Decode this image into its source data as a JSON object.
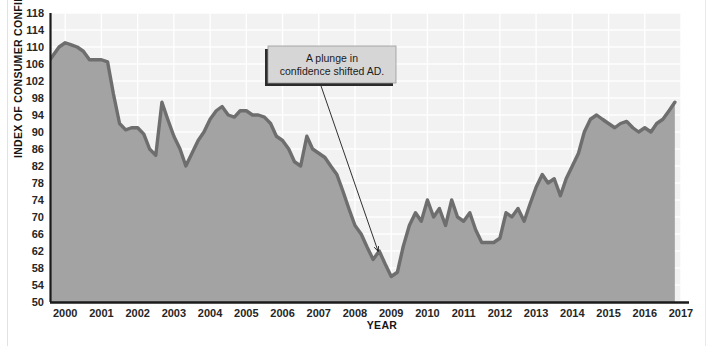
{
  "chart_data": {
    "type": "area",
    "title": "",
    "xlabel": "YEAR",
    "ylabel": "INDEX OF CONSUMER CONFIDENCE",
    "xlim": [
      1999.58,
      2017.0
    ],
    "ylim": [
      50,
      118
    ],
    "ytick_step": 4,
    "grid": true,
    "legend": false,
    "yticks": [
      50,
      54,
      58,
      62,
      66,
      70,
      74,
      78,
      82,
      86,
      90,
      94,
      98,
      102,
      106,
      110,
      114,
      118
    ],
    "xticks": [
      2000,
      2001,
      2002,
      2003,
      2004,
      2005,
      2006,
      2007,
      2008,
      2009,
      2010,
      2011,
      2012,
      2013,
      2014,
      2015,
      2016,
      2017
    ],
    "colors": {
      "line": "#6e6e6e",
      "fill": "#a3a3a3",
      "plot_background": "#f2f2f2",
      "gridline": "#ffffff",
      "axis": "#1a1a1a",
      "text": "#262626",
      "callout_fill": "#d6d6d6",
      "callout_shadow": "#2b2b2b"
    },
    "series": [
      {
        "name": "Index of Consumer Confidence",
        "x": [
          1999.58,
          1999.83,
          2000.0,
          2000.17,
          2000.33,
          2000.5,
          2000.67,
          2000.83,
          2001.0,
          2001.17,
          2001.33,
          2001.5,
          2001.67,
          2001.83,
          2002.0,
          2002.17,
          2002.33,
          2002.5,
          2002.67,
          2002.83,
          2003.0,
          2003.17,
          2003.33,
          2003.5,
          2003.67,
          2003.83,
          2004.0,
          2004.17,
          2004.33,
          2004.5,
          2004.67,
          2004.83,
          2005.0,
          2005.17,
          2005.33,
          2005.5,
          2005.67,
          2005.83,
          2006.0,
          2006.17,
          2006.33,
          2006.5,
          2006.67,
          2006.83,
          2007.0,
          2007.17,
          2007.33,
          2007.5,
          2007.67,
          2007.83,
          2008.0,
          2008.17,
          2008.33,
          2008.5,
          2008.67,
          2008.83,
          2009.0,
          2009.17,
          2009.33,
          2009.5,
          2009.67,
          2009.83,
          2010.0,
          2010.17,
          2010.33,
          2010.5,
          2010.67,
          2010.83,
          2011.0,
          2011.17,
          2011.33,
          2011.5,
          2011.67,
          2011.83,
          2012.0,
          2012.17,
          2012.33,
          2012.5,
          2012.67,
          2012.83,
          2013.0,
          2013.17,
          2013.33,
          2013.5,
          2013.67,
          2013.83,
          2014.0,
          2014.17,
          2014.33,
          2014.5,
          2014.67,
          2014.83,
          2015.0,
          2015.17,
          2015.33,
          2015.5,
          2015.67,
          2015.83,
          2016.0,
          2016.17,
          2016.33,
          2016.5,
          2016.67,
          2016.83
        ],
        "values": [
          107,
          110,
          111,
          110.5,
          110,
          109,
          107,
          107,
          107,
          106.5,
          99,
          92,
          90.5,
          91,
          91,
          89.5,
          86,
          84.5,
          97,
          93,
          89,
          86,
          82,
          85,
          88,
          90,
          93,
          95,
          96,
          94,
          93.5,
          95,
          95,
          94,
          94,
          93.5,
          92,
          89,
          88,
          86,
          83,
          82,
          89,
          86,
          85,
          84,
          82,
          80,
          76,
          72,
          68,
          66,
          63,
          60,
          62,
          59,
          56,
          57,
          63,
          68,
          71,
          69,
          74,
          70,
          72,
          68,
          74,
          70,
          69,
          71,
          67,
          64,
          64,
          64,
          65,
          71,
          70,
          72,
          69,
          73,
          77,
          80,
          78,
          79,
          75,
          79,
          82,
          85,
          90,
          93,
          94,
          93,
          92,
          91,
          92,
          92.5,
          91,
          90,
          91,
          90,
          92,
          93,
          95,
          97
        ]
      }
    ],
    "annotations": [
      {
        "name": "plunge-callout",
        "text_lines": [
          "A plunge in",
          "confidence shifted AD."
        ],
        "box_x": 268,
        "box_y": 46,
        "box_w": 128,
        "box_h": 37,
        "arrow_from_x": 320,
        "arrow_from_y": 83,
        "arrow_to_x": 378,
        "arrow_to_y": 251
      }
    ]
  }
}
